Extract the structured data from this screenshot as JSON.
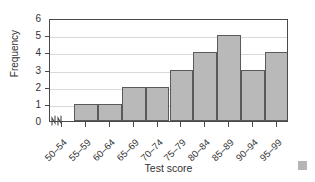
{
  "chart_data": {
    "type": "bar",
    "title": "",
    "subtitle": "",
    "xlabel": "Test score",
    "ylabel": "Frequency",
    "categories": [
      "50–54",
      "55–59",
      "60–64",
      "65–69",
      "70–74",
      "75–79",
      "80–84",
      "85–89",
      "90–94",
      "95–99"
    ],
    "values": [
      0,
      1,
      1,
      2,
      2,
      3,
      4,
      5,
      3,
      4
    ],
    "ylim": [
      0,
      6
    ],
    "yticks": [
      0,
      1,
      2,
      3,
      4,
      5,
      6
    ],
    "ytick_labels": [
      "0",
      "1",
      "2",
      "3",
      "4",
      "5",
      "6"
    ],
    "grid": true,
    "grid_axis": "y",
    "legend": null,
    "legend_position": "none",
    "annotations": [
      "x-axis break after origin"
    ],
    "bar_fill_color": "#b9b9b9",
    "bar_edge_color": "#5a5a5a",
    "grid_color": "#d9d9d9",
    "axis_color": "#4a4a4a",
    "text_color": "#333333"
  },
  "figure": {
    "xaxis_title": "Test score",
    "yaxis_title": "Frequency"
  }
}
